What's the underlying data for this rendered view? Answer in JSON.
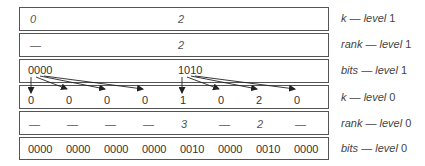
{
  "rows": {
    "k_level1": {
      "values": [
        "0",
        "2"
      ],
      "label_name": "k",
      "label_sep": " — ",
      "label_level": "level",
      "label_num": " 1"
    },
    "rank_level1": {
      "values": [
        "—",
        "2"
      ],
      "label_name": "rank",
      "label_sep": " — ",
      "label_level": "level",
      "label_num": " 1"
    },
    "bits_level1": {
      "values": [
        "0000",
        "1010"
      ],
      "label_name": "bits",
      "label_sep": " — ",
      "label_level": "level",
      "label_num": " 1"
    },
    "k_level0": {
      "values": [
        "0",
        "0",
        "0",
        "0",
        "1",
        "0",
        "2",
        "0"
      ],
      "label_name": "k",
      "label_sep": " — ",
      "label_level": "level",
      "label_num": " 0"
    },
    "rank_level0": {
      "values": [
        "—",
        "—",
        "—",
        "—",
        "3",
        "—",
        "2",
        "—"
      ],
      "label_name": "rank",
      "label_sep": " — ",
      "label_level": "level",
      "label_num": " 0"
    },
    "bits_level0": {
      "values": [
        "0000",
        "0000",
        "0000",
        "0000",
        "0010",
        "0000",
        "0010",
        "0000"
      ],
      "label_name": "bits",
      "label_sep": " — ",
      "label_level": "level",
      "label_num": " 0"
    }
  },
  "colors": {
    "border": "#555555",
    "arrow": "#222222",
    "text": "#333333"
  }
}
